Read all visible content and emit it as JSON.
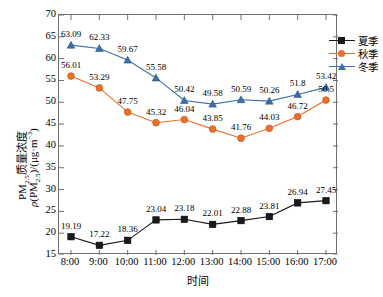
{
  "chart_data": {
    "type": "line",
    "title": "",
    "xlabel": "时间",
    "ylabel_line1": "PM2.5质量浓度",
    "ylabel_line2": "ρ(PM2.5)/(μg·m-3)",
    "categories": [
      "8:00",
      "9:00",
      "10:00",
      "11:00",
      "12:00",
      "13:00",
      "14:00",
      "15:00",
      "16:00",
      "17:00"
    ],
    "ylim": [
      15,
      70
    ],
    "yticks": [
      15,
      20,
      25,
      30,
      35,
      40,
      45,
      50,
      55,
      60,
      65,
      70
    ],
    "grid": false,
    "legend_position": "top-right",
    "series": [
      {
        "name": "夏季",
        "color": "#1a1a1a",
        "marker": "square",
        "values": [
          19.19,
          17.22,
          18.36,
          23.04,
          23.18,
          22.01,
          22.88,
          23.81,
          26.94,
          27.45
        ],
        "labels": [
          "19.19",
          "17.22",
          "18.36",
          "23.04",
          "23.18",
          "22.01",
          "22.88",
          "23.81",
          "26.94",
          "27.45"
        ]
      },
      {
        "name": "秋季",
        "color": "#e8702a",
        "marker": "circle",
        "values": [
          56.01,
          53.29,
          47.75,
          45.32,
          46.04,
          43.85,
          41.76,
          44.03,
          46.72,
          50.5
        ],
        "labels": [
          "56.01",
          "53.29",
          "47.75",
          "45.32",
          "46.04",
          "43.85",
          "41.76",
          "44.03",
          "46.72",
          "50.5"
        ]
      },
      {
        "name": "冬季",
        "color": "#3a6fa8",
        "marker": "triangle",
        "values": [
          63.09,
          62.33,
          59.67,
          55.58,
          50.42,
          49.58,
          50.59,
          50.26,
          51.8,
          53.42
        ],
        "labels": [
          "63.09",
          "62.33",
          "59.67",
          "55.58",
          "50.42",
          "49.58",
          "50.59",
          "50.26",
          "51.8",
          "53.42"
        ]
      }
    ]
  },
  "legend": {
    "items": [
      {
        "label": "夏季"
      },
      {
        "label": "秋季"
      },
      {
        "label": "冬季"
      }
    ]
  },
  "axes": {
    "x_title": "时间",
    "y_title_main": "PM",
    "y_title_sub": "2.5",
    "y_title_rest": "质量浓度"
  }
}
